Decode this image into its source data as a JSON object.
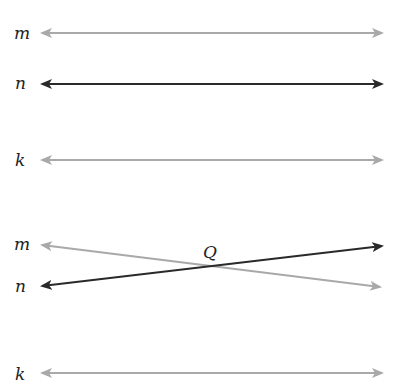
{
  "figure_top": {
    "description": "Three parallel lines",
    "lines": [
      {
        "label": "m",
        "color": "#a9a9a9"
      },
      {
        "label": "n",
        "color": "#2a2a2a"
      },
      {
        "label": "k",
        "color": "#a9a9a9"
      }
    ]
  },
  "figure_bottom": {
    "description": "Lines m and n intersect at point Q; line k separate",
    "lines": [
      {
        "label": "m",
        "color": "#a9a9a9"
      },
      {
        "label": "n",
        "color": "#2a2a2a"
      },
      {
        "label": "k",
        "color": "#a9a9a9"
      }
    ],
    "point": {
      "label": "Q"
    }
  }
}
